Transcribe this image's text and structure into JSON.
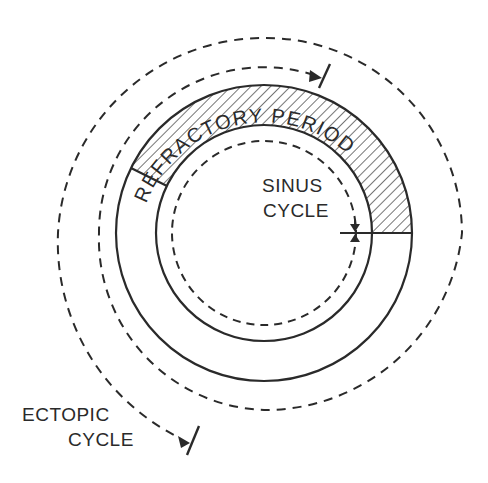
{
  "diagram": {
    "labels": {
      "refractory": "REFRACTORY PERIOD",
      "sinus_line1": "SINUS",
      "sinus_line2": "CYCLE",
      "ectopic_line1": "ECTOPIC",
      "ectopic_line2": "CYCLE"
    },
    "colors": {
      "stroke": "#2a2a2a",
      "background": "#ffffff"
    },
    "geometry": {
      "center": [
        264,
        233
      ],
      "outer_solid_radius": 148,
      "inner_solid_radius": 108,
      "sinus_dashed_radius": 92,
      "refractory_start_angle_deg": 154,
      "refractory_end_angle_deg": 0
    }
  }
}
